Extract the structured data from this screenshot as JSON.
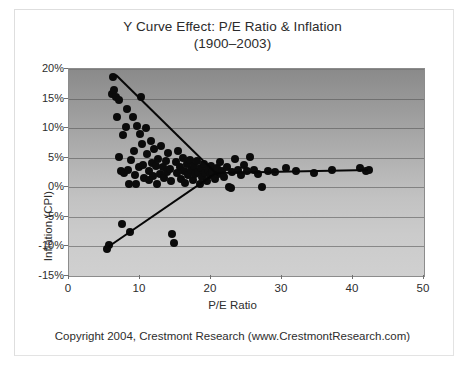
{
  "chart_data": {
    "type": "scatter",
    "title": "Y Curve Effect: P/E Ratio & Inflation",
    "subtitle": "(1900–2003)",
    "xlabel": "P/E Ratio",
    "ylabel": "Inflation (CPI)",
    "xlim": [
      0,
      50
    ],
    "ylim": [
      -0.15,
      0.2
    ],
    "xticks": [
      "0",
      "10",
      "20",
      "30",
      "40",
      "50"
    ],
    "xtick_values": [
      0,
      10,
      20,
      30,
      40,
      50
    ],
    "yticks": [
      "20%",
      "15%",
      "10%",
      "5%",
      "0%",
      "-5%",
      "-10%",
      "-15%"
    ],
    "ytick_values": [
      0.2,
      0.15,
      0.1,
      0.05,
      0.0,
      -0.05,
      -0.1,
      -0.15
    ],
    "grid": true,
    "grid_axis": "y",
    "legend": null,
    "marker_color": "#0b0b0b",
    "trendline_color": "#070707",
    "plot_background": "vertical gradient dark-gray to light-gray",
    "footer": "Copyright 2004, Crestmont Research (www.CrestmontResearch.com)",
    "annotations": [],
    "series": [
      {
        "name": "P/E vs Inflation (1900-2003)",
        "points": [
          [
            5.3,
            -0.104
          ],
          [
            5.6,
            -0.098
          ],
          [
            6.0,
            0.157
          ],
          [
            6.2,
            0.186
          ],
          [
            6.4,
            0.164
          ],
          [
            6.6,
            0.152
          ],
          [
            6.8,
            0.118
          ],
          [
            7.0,
            0.148
          ],
          [
            7.1,
            0.052
          ],
          [
            7.3,
            0.028
          ],
          [
            7.4,
            -0.062
          ],
          [
            7.6,
            0.088
          ],
          [
            7.8,
            0.024
          ],
          [
            8.0,
            0.102
          ],
          [
            8.2,
            0.132
          ],
          [
            8.3,
            0.03
          ],
          [
            8.5,
            0.005
          ],
          [
            8.6,
            -0.075
          ],
          [
            8.8,
            0.046
          ],
          [
            9.0,
            0.118
          ],
          [
            9.2,
            0.062
          ],
          [
            9.3,
            0.021
          ],
          [
            9.5,
            0.006
          ],
          [
            9.6,
            0.104
          ],
          [
            9.8,
            0.035
          ],
          [
            10.0,
            0.09
          ],
          [
            10.1,
            0.152
          ],
          [
            10.3,
            0.073
          ],
          [
            10.4,
            0.038
          ],
          [
            10.6,
            0.016
          ],
          [
            10.8,
            0.1
          ],
          [
            11.0,
            0.056
          ],
          [
            11.2,
            0.027
          ],
          [
            11.3,
            0.012
          ],
          [
            11.5,
            0.078
          ],
          [
            11.7,
            0.041
          ],
          [
            11.9,
            0.019
          ],
          [
            12.0,
            0.064
          ],
          [
            12.2,
            0.036
          ],
          [
            12.4,
            0.006
          ],
          [
            12.6,
            0.048
          ],
          [
            12.8,
            0.022
          ],
          [
            13.0,
            0.07
          ],
          [
            13.2,
            0.034
          ],
          [
            13.4,
            0.015
          ],
          [
            13.6,
            0.044
          ],
          [
            13.8,
            0.026
          ],
          [
            14.0,
            0.058
          ],
          [
            14.2,
            0.031
          ],
          [
            14.4,
            0.01
          ],
          [
            14.5,
            -0.079
          ],
          [
            14.8,
            -0.095
          ],
          [
            15.0,
            0.042
          ],
          [
            15.2,
            0.024
          ],
          [
            15.4,
            0.062
          ],
          [
            15.6,
            0.035
          ],
          [
            15.8,
            0.014
          ],
          [
            16.0,
            0.05
          ],
          [
            16.2,
            0.028
          ],
          [
            16.4,
            0.008
          ],
          [
            16.6,
            0.04
          ],
          [
            16.8,
            0.02
          ],
          [
            17.0,
            0.046
          ],
          [
            17.2,
            0.03
          ],
          [
            17.4,
            0.012
          ],
          [
            17.6,
            0.036
          ],
          [
            17.8,
            0.022
          ],
          [
            18.0,
            0.044
          ],
          [
            18.2,
            0.026
          ],
          [
            18.4,
            0.006
          ],
          [
            18.6,
            0.032
          ],
          [
            18.8,
            0.018
          ],
          [
            19.0,
            0.04
          ],
          [
            19.2,
            0.024
          ],
          [
            19.4,
            0.01
          ],
          [
            19.6,
            0.03
          ],
          [
            19.8,
            0.02
          ],
          [
            20.0,
            0.036
          ],
          [
            20.2,
            0.026
          ],
          [
            20.5,
            0.014
          ],
          [
            20.8,
            0.032
          ],
          [
            21.0,
            0.022
          ],
          [
            21.3,
            0.042
          ],
          [
            21.6,
            0.028
          ],
          [
            21.9,
            0.018
          ],
          [
            22.2,
            0.034
          ],
          [
            22.5,
            0.0
          ],
          [
            22.8,
            -0.002
          ],
          [
            23.0,
            0.026
          ],
          [
            23.4,
            0.048
          ],
          [
            23.8,
            0.03
          ],
          [
            24.2,
            0.02
          ],
          [
            24.6,
            0.038
          ],
          [
            25.0,
            0.028
          ],
          [
            25.5,
            0.052
          ],
          [
            26.0,
            0.03
          ],
          [
            26.6,
            0.022
          ],
          [
            27.2,
            0.0
          ],
          [
            28.0,
            0.028
          ],
          [
            29.0,
            0.026
          ],
          [
            30.5,
            0.032
          ],
          [
            32.0,
            0.028
          ],
          [
            34.5,
            0.024
          ],
          [
            37.0,
            0.03
          ],
          [
            41.0,
            0.032
          ],
          [
            41.8,
            0.028
          ],
          [
            42.2,
            0.03
          ]
        ]
      }
    ],
    "trendlines": [
      {
        "name": "upper-branch",
        "description": "Descending branch: high inflation falls as P/E rises",
        "x0": 6.6,
        "y0": 0.192,
        "x1": 21.0,
        "y1": 0.022
      },
      {
        "name": "lower-branch",
        "description": "Ascending branch: deflation rises toward low-positive inflation as P/E rises",
        "x0": 5.5,
        "y0": -0.1,
        "x1": 20.8,
        "y1": 0.026
      },
      {
        "name": "right-branch",
        "description": "Flat branch at low-positive inflation extending to high P/E",
        "x0": 20.8,
        "y0": 0.026,
        "x1": 42.0,
        "y1": 0.031
      }
    ]
  }
}
